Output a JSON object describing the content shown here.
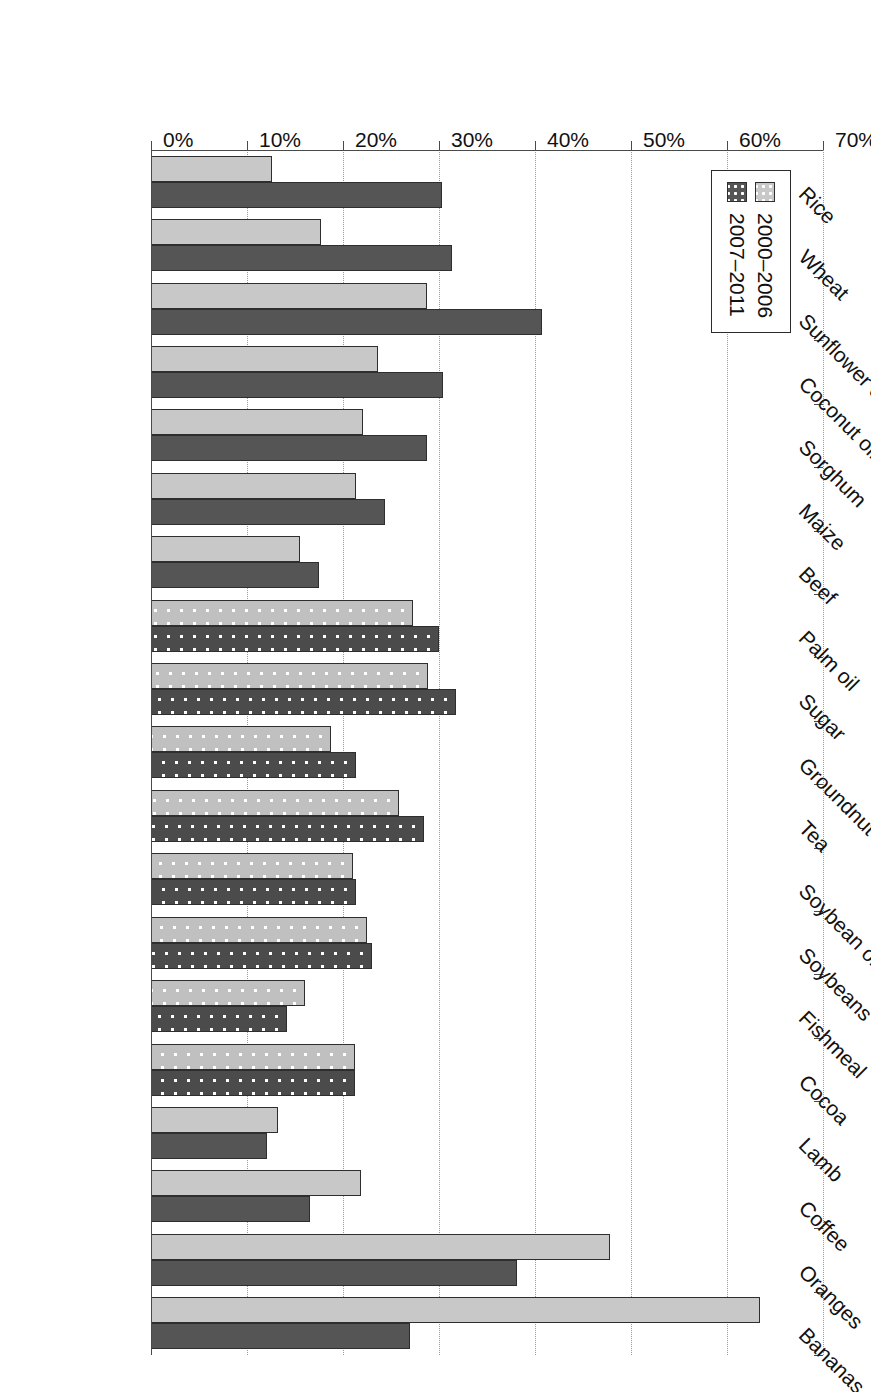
{
  "chart_data": {
    "type": "bar",
    "orientation": "horizontal",
    "title": "",
    "subtitle": "",
    "xlabel": "",
    "ylabel": "",
    "ylim": [
      0,
      70
    ],
    "tick_labels": [
      "0%",
      "10%",
      "20%",
      "30%",
      "40%",
      "50%",
      "60%",
      "70%"
    ],
    "tick_values": [
      0,
      10,
      20,
      30,
      40,
      50,
      60,
      70
    ],
    "grid": true,
    "legend_position": "upper-left",
    "categories": [
      "Rice",
      "Wheat",
      "Sunflower oil",
      "Coconut oil",
      "Sorghum",
      "Maize",
      "Beef",
      "Palm oil",
      "Sugar",
      "Groundnut oil",
      "Tea",
      "Soybean oil",
      "Soybeans",
      "Fishmeal",
      "Cocoa",
      "Lamb",
      "Coffee",
      "Oranges",
      "Bananas"
    ],
    "series": [
      {
        "name": "2000–2006",
        "color": "#c8c8c8",
        "values": [
          12.6,
          17.7,
          28.8,
          23.6,
          22.1,
          21.4,
          15.5,
          27.3,
          28.9,
          18.7,
          25.8,
          21.0,
          22.5,
          16.0,
          21.2,
          13.2,
          21.9,
          47.8,
          63.4
        ]
      },
      {
        "name": "2007–2011",
        "color": "#555555",
        "values": [
          30.3,
          31.4,
          40.7,
          30.4,
          28.8,
          24.4,
          17.5,
          30.0,
          31.8,
          21.4,
          28.4,
          21.4,
          23.0,
          14.2,
          21.3,
          12.1,
          16.6,
          38.1,
          27.0
        ]
      }
    ],
    "textured_categories": [
      "Palm oil",
      "Sugar",
      "Groundnut oil",
      "Tea",
      "Soybean oil",
      "Soybeans",
      "Fishmeal",
      "Cocoa"
    ]
  },
  "legend": {
    "items": [
      {
        "label": "2000–2006",
        "swatch": "light-gray-dotted"
      },
      {
        "label": "2007–2011",
        "swatch": "dark-gray-dotted"
      }
    ]
  }
}
